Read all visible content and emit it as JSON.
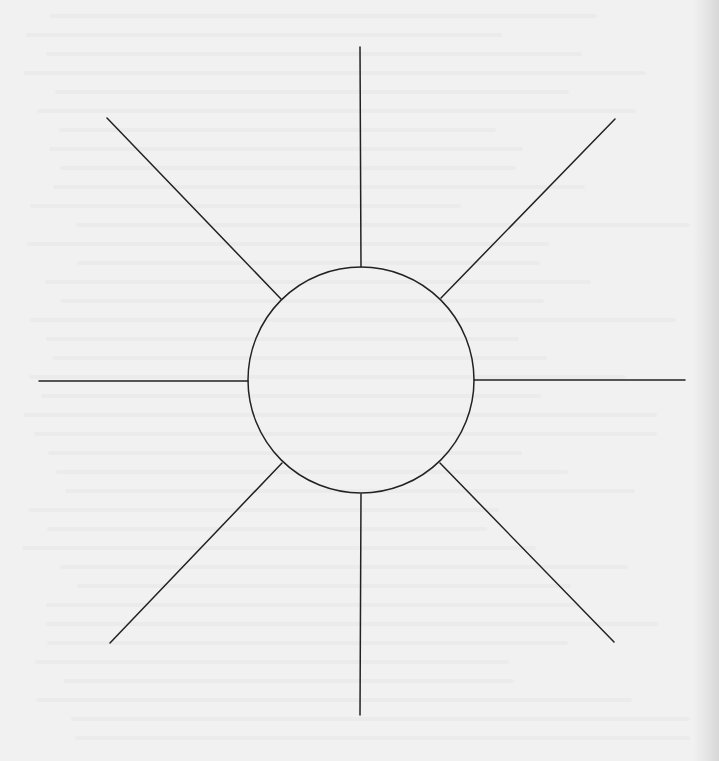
{
  "diagram": {
    "type": "sun-diagram",
    "description": "Blank sun / spider diagram: a central circle with eight evenly spaced radiating spokes",
    "center_label": "",
    "spoke_labels": [
      "",
      "",
      "",
      "",
      "",
      "",
      "",
      ""
    ],
    "colors": {
      "background": "#f1f1f1",
      "stroke": "#222222"
    },
    "circle": {
      "cx": 361,
      "cy": 380,
      "r": 113
    },
    "spokes": [
      {
        "name": "spoke-north",
        "x1": 361,
        "y1": 267,
        "x2": 360,
        "y2": 47
      },
      {
        "name": "spoke-north-east",
        "x1": 441,
        "y1": 298,
        "x2": 615,
        "y2": 119
      },
      {
        "name": "spoke-east",
        "x1": 474,
        "y1": 380,
        "x2": 685,
        "y2": 380
      },
      {
        "name": "spoke-south-east",
        "x1": 440,
        "y1": 463,
        "x2": 614,
        "y2": 642
      },
      {
        "name": "spoke-south",
        "x1": 361,
        "y1": 494,
        "x2": 360,
        "y2": 715
      },
      {
        "name": "spoke-south-west",
        "x1": 282,
        "y1": 463,
        "x2": 110,
        "y2": 643
      },
      {
        "name": "spoke-west",
        "x1": 248,
        "y1": 381,
        "x2": 39,
        "y2": 381
      },
      {
        "name": "spoke-north-west",
        "x1": 281,
        "y1": 299,
        "x2": 107,
        "y2": 118
      }
    ]
  }
}
